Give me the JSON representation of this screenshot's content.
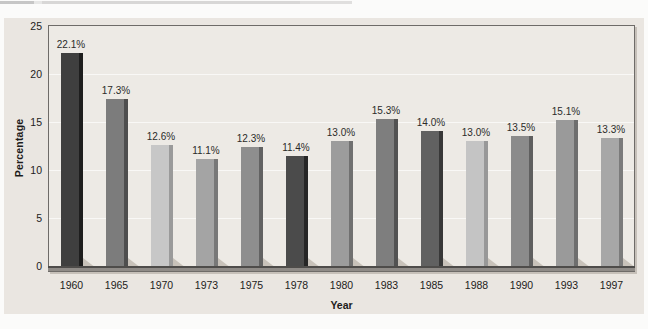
{
  "page": {
    "background": "#fbfbfa",
    "panel_background": "#eae6e1",
    "plot_background": "#edeae5",
    "axis_color": "#6e6b68",
    "shadow_color": "#c8c2ba"
  },
  "chart_data": {
    "type": "bar",
    "title": "",
    "xlabel": "Year",
    "ylabel": "Percentage",
    "ylim": [
      0,
      25
    ],
    "yticks": [
      0,
      5,
      10,
      15,
      20,
      25
    ],
    "grid": true,
    "legend": "none",
    "categories": [
      "1960",
      "1965",
      "1970",
      "1973",
      "1975",
      "1978",
      "1980",
      "1983",
      "1985",
      "1988",
      "1990",
      "1993",
      "1997"
    ],
    "values": [
      22.1,
      17.3,
      12.6,
      11.1,
      12.3,
      11.4,
      13.0,
      15.3,
      14.0,
      13.0,
      13.5,
      15.1,
      13.3
    ],
    "value_labels": [
      "22.1%",
      "17.3%",
      "12.6%",
      "11.1%",
      "12.3%",
      "11.4%",
      "13.0%",
      "15.3%",
      "14.0%",
      "13.0%",
      "13.5%",
      "15.1%",
      "13.3%"
    ],
    "bar_face_colors": [
      "#3f3f3f",
      "#7c7c7c",
      "#c7c7c7",
      "#a4a4a4",
      "#8e8e8e",
      "#4b4b4b",
      "#9c9c9c",
      "#7e7e7e",
      "#616161",
      "#c4c4c4",
      "#8b8b8b",
      "#9a9a9a",
      "#a7a7a7"
    ],
    "bar_side_colors": [
      "#1e1e1e",
      "#4e4e4e",
      "#9a9a9a",
      "#787878",
      "#626262",
      "#262626",
      "#707070",
      "#525252",
      "#383838",
      "#989898",
      "#5f5f5f",
      "#6e6e6e",
      "#7b7b7b"
    ]
  }
}
